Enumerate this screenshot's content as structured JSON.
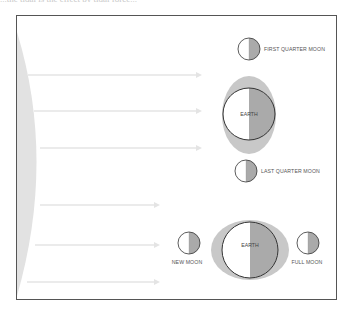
{
  "caption_fragment": "...the tidal is the effect by tidal force...",
  "colors": {
    "frame": "#555555",
    "sun": "#e2e2e2",
    "arrow": "#e4e4e4",
    "tidal_bulge": "#c8c8c8",
    "shadow_half": "#aaaaaa",
    "outline": "#333333",
    "background": "#ffffff"
  },
  "diagram": {
    "sun": {
      "label": ""
    },
    "arrows": [
      {
        "y": 75,
        "x1": 28,
        "x2": 200
      },
      {
        "y": 111,
        "x1": 34,
        "x2": 200
      },
      {
        "y": 148,
        "x1": 40,
        "x2": 200
      },
      {
        "y": 205,
        "x1": 40,
        "x2": 158
      },
      {
        "y": 245,
        "x1": 35,
        "x2": 158
      },
      {
        "y": 282,
        "x1": 27,
        "x2": 158
      }
    ],
    "top_configuration": {
      "earth_label": "EARTH",
      "first_quarter_label": "FIRST QUARTER MOON",
      "last_quarter_label": "LAST QUARTER MOON"
    },
    "bottom_configuration": {
      "earth_label": "EARTH",
      "new_moon_label": "NEW MOON",
      "full_moon_label": "FULL MOON"
    }
  }
}
